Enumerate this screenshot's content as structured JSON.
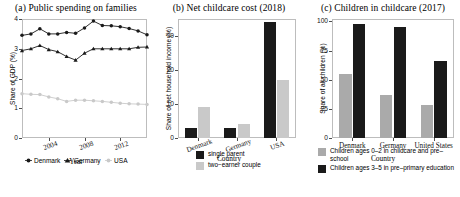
{
  "figure": {
    "panels": [
      {
        "key": "a",
        "title": "(a) Public spending on families",
        "ylabel": "Share of GDP (%)",
        "xlabel": "Year"
      },
      {
        "key": "b",
        "title": "(b) Net childcare cost (2018)",
        "ylabel": "Share of net household income (%)",
        "xlabel": "Country"
      },
      {
        "key": "c",
        "title": "(c) Children in childcare (2017)",
        "ylabel": "Share of all children (%)",
        "xlabel": "Country"
      }
    ],
    "colors": {
      "dark": "#1a1a1a",
      "light": "#c9c9c9",
      "axis": "#bdbdbd",
      "tick": "#4d4d4d"
    }
  },
  "chart_data": [
    {
      "type": "line",
      "panel": "a",
      "title": "(a) Public spending on families",
      "xlabel": "Year",
      "ylabel": "Share of GDP (%)",
      "xlim": [
        2001,
        2015
      ],
      "ylim": [
        0,
        4
      ],
      "yticks": [
        0,
        1,
        2,
        3,
        4
      ],
      "ytick_labels": [
        "0",
        "1",
        "2",
        "3",
        "4"
      ],
      "xticks": [
        2004,
        2008,
        2012
      ],
      "xtick_labels": [
        "2004",
        "2008",
        "2012"
      ],
      "grid": false,
      "legend_position": "bottom",
      "x": [
        2001,
        2002,
        2003,
        2004,
        2005,
        2006,
        2007,
        2008,
        2009,
        2010,
        2011,
        2012,
        2013,
        2014,
        2015
      ],
      "series": [
        {
          "name": "Denmark",
          "marker": "circle",
          "color": "#1a1a1a",
          "values": [
            3.45,
            3.5,
            3.67,
            3.5,
            3.5,
            3.55,
            3.52,
            3.7,
            3.93,
            3.78,
            3.77,
            3.74,
            3.68,
            3.6,
            3.47
          ]
        },
        {
          "name": "Germany",
          "marker": "triangle",
          "color": "#1a1a1a",
          "values": [
            2.94,
            3.0,
            3.11,
            2.97,
            2.9,
            2.74,
            2.62,
            2.85,
            3.0,
            3.0,
            3.0,
            3.0,
            3.0,
            3.05,
            3.06
          ]
        },
        {
          "name": "USA",
          "marker": "circle",
          "color": "#c9c9c9",
          "values": [
            1.49,
            1.47,
            1.46,
            1.38,
            1.32,
            1.23,
            1.27,
            1.27,
            1.25,
            1.23,
            1.2,
            1.17,
            1.15,
            1.14,
            1.13
          ]
        }
      ]
    },
    {
      "type": "bar",
      "panel": "b",
      "title": "(b) Net childcare cost (2018)",
      "xlabel": "Country",
      "ylabel": "Share of net household income (%)",
      "categories": [
        "Denmark",
        "Germany",
        "USA"
      ],
      "ylim": [
        0,
        35
      ],
      "yticks": [
        0,
        10,
        20,
        30
      ],
      "ytick_labels": [
        "0",
        "10",
        "20",
        "30"
      ],
      "grid": false,
      "legend_position": "bottom",
      "series": [
        {
          "name": "single parent",
          "color": "#1a1a1a",
          "values": [
            3,
            3,
            34
          ]
        },
        {
          "name": "two-earner couple",
          "color": "#c9c9c9",
          "values": [
            9,
            4,
            17
          ]
        }
      ]
    },
    {
      "type": "bar",
      "panel": "c",
      "title": "(c) Children in childcare (2017)",
      "xlabel": "Country",
      "ylabel": "Share of all children (%)",
      "categories": [
        "Denmark",
        "Germany",
        "United States"
      ],
      "ylim": [
        0,
        102
      ],
      "yticks": [
        0,
        25,
        50,
        75,
        100
      ],
      "ytick_labels": [
        "0",
        "25",
        "50",
        "75",
        "100"
      ],
      "grid": false,
      "legend_position": "bottom",
      "series": [
        {
          "name": "Children ages 0–2 in childcare and pre–school",
          "color": "#aaaaaa",
          "values": [
            55,
            37,
            28
          ]
        },
        {
          "name": "Children ages 3–5 in pre–primary education",
          "color": "#1a1a1a",
          "values": [
            98,
            95,
            66
          ]
        }
      ]
    }
  ],
  "legends": {
    "a": [
      {
        "label": "Denmark",
        "marker": "circle",
        "color": "#1a1a1a"
      },
      {
        "label": "Germany",
        "marker": "triangle",
        "color": "#1a1a1a"
      },
      {
        "label": "USA",
        "marker": "circle",
        "color": "#c9c9c9"
      }
    ],
    "b": [
      {
        "label": "single parent",
        "color": "#1a1a1a"
      },
      {
        "label": "two−earner couple",
        "color": "#c9c9c9"
      }
    ],
    "c": [
      {
        "label": "Children ages 0–2 in childcare and pre–school",
        "color": "#aaaaaa"
      },
      {
        "label": "Children ages 3–5 in pre–primary education",
        "color": "#1a1a1a"
      }
    ]
  }
}
